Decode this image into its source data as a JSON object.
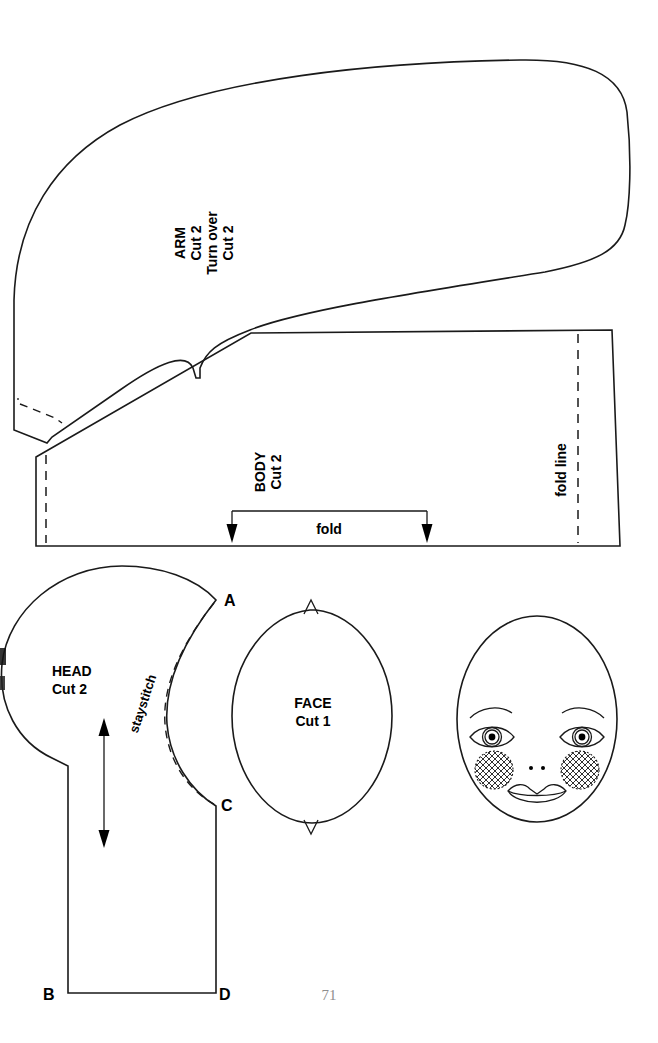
{
  "page": {
    "number": "71",
    "kind": "sewing-pattern-sheet",
    "ink_color": "#1a1a1a",
    "background": "#ffffff",
    "page_number_color": "#8d8d8d"
  },
  "pieces": {
    "arm": {
      "name": "ARM",
      "cut_line1": "Cut 2",
      "turn_over": "Turn over",
      "cut_line2": "Cut 2",
      "label_rotation": "-90",
      "markings": [
        "dashed hem stitching line at lower left"
      ]
    },
    "body": {
      "name": "BODY",
      "cut": "Cut 2",
      "label_rotation": "-90",
      "fold_line_label": "fold line",
      "fold_label": "fold",
      "markings": [
        "vertical dashed fold line at right",
        "vertical dashed seam line at left",
        "fold bracket with two down arrows at bottom"
      ]
    },
    "head": {
      "name": "HEAD",
      "cut": "Cut 1 or 2",
      "cut_text": "Cut 2",
      "staystitch_label": "staystitch",
      "points": [
        "A",
        "B",
        "C",
        "D"
      ],
      "markings": [
        "double-headed grainline arrow",
        "dashed staystitch curve from A to C"
      ]
    },
    "face": {
      "name": "FACE",
      "cut": "Cut 1",
      "markings": [
        "V notch at top",
        "V notch at bottom"
      ]
    },
    "face_drawing": {
      "name": "face-placement-diagram",
      "features": [
        "eyebrow-left",
        "eyebrow-right",
        "eye-left",
        "eye-right",
        "nostrils",
        "cheek-left",
        "cheek-right",
        "mouth"
      ]
    }
  }
}
